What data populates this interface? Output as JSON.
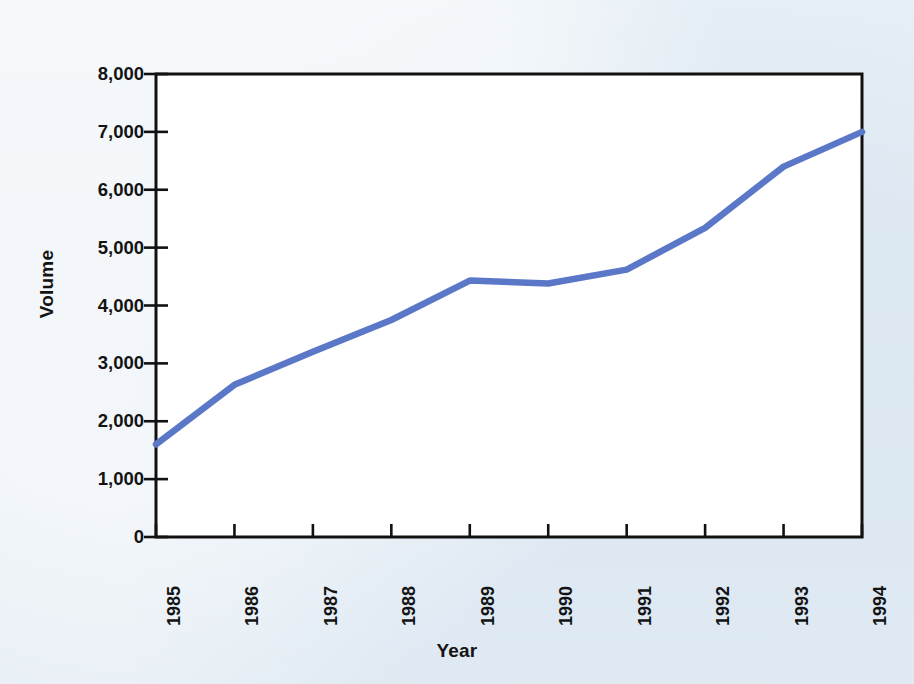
{
  "chart_data": {
    "type": "line",
    "title": "",
    "xlabel": "Year",
    "ylabel": "Volume",
    "categories": [
      "1985",
      "1986",
      "1987",
      "1988",
      "1989",
      "1990",
      "1991",
      "1992",
      "1993",
      "1994"
    ],
    "values": [
      1600,
      2630,
      3200,
      3750,
      4430,
      4380,
      4620,
      5340,
      6400,
      7000
    ],
    "series": [
      {
        "name": "Volume",
        "values": [
          1600,
          2630,
          3200,
          3750,
          4430,
          4380,
          4620,
          5340,
          6400,
          7000
        ]
      }
    ],
    "ylim": [
      0,
      8000
    ],
    "y_ticks": [
      0,
      1000,
      2000,
      3000,
      4000,
      5000,
      6000,
      7000,
      8000
    ],
    "y_tick_labels": [
      "0",
      "1,000",
      "2,000",
      "3,000",
      "4,000",
      "5,000",
      "6,000",
      "7,000",
      "8,000"
    ],
    "x_tick_labels": [
      "1985",
      "1986",
      "1987",
      "1988",
      "1989",
      "1990",
      "1991",
      "1992",
      "1993",
      "1994"
    ],
    "grid": false,
    "legend": "none",
    "line_color": "#5b77c8",
    "axis_color": "#111111",
    "plot_background": "#ffffff",
    "page_background": "#e7eef5"
  },
  "axes": {
    "y_title": "Volume",
    "x_title": "Year"
  }
}
